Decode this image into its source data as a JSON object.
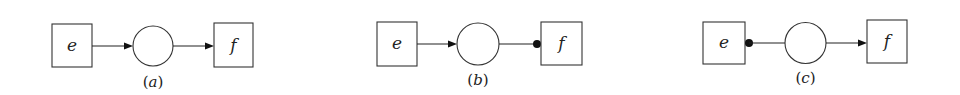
{
  "figure": {
    "panels": [
      {
        "id": "a",
        "caption": "(a)",
        "caption_letter": "a",
        "source_label": "e",
        "target_label": "f",
        "source_edge_end": "arrow",
        "target_edge_end": "arrow"
      },
      {
        "id": "b",
        "caption": "(b)",
        "caption_letter": "b",
        "source_label": "e",
        "target_label": "f",
        "source_edge_end": "arrow",
        "target_edge_end": "dot"
      },
      {
        "id": "c",
        "caption": "(c)",
        "caption_letter": "c",
        "source_label": "e",
        "target_label": "f",
        "source_edge_end": "dot",
        "target_edge_end": "arrow"
      }
    ],
    "colors": {
      "stroke": "#333333",
      "fill": "#ffffff",
      "marker": "#111111"
    }
  }
}
